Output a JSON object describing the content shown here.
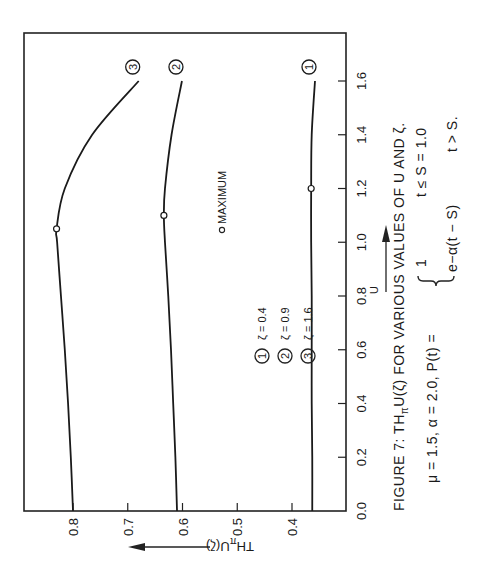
{
  "chart_data": {
    "type": "line",
    "title": "FIGURE 7:  THπU(ζ) FOR VARIOUS VALUES OF U AND ζ.",
    "xlabel": "U",
    "ylabel": "THπU(ζ)",
    "xlim": [
      0.0,
      1.75
    ],
    "ylim": [
      0.3,
      0.89
    ],
    "xticks": [
      0.0,
      0.2,
      0.4,
      0.6,
      0.8,
      1.0,
      1.2,
      1.4,
      1.6
    ],
    "xtick_labels": [
      "0.0",
      "0.2",
      "0.4",
      "0.6",
      "0.8",
      "1.0",
      "1.2",
      "1.4",
      "1.6"
    ],
    "yticks": [
      0.4,
      0.5,
      0.6,
      0.7,
      0.8
    ],
    "ytick_labels": [
      "0.4",
      "0.5",
      "0.6",
      "0.7",
      "0.8"
    ],
    "grid": false,
    "orientation": "rotated 90° counter-clockwise",
    "series": [
      {
        "name": "ζ = 0.4",
        "marker_label": "1",
        "x": [
          0.0,
          0.2,
          0.4,
          0.6,
          0.8,
          1.0,
          1.2,
          1.4,
          1.6
        ],
        "y": [
          0.363,
          0.363,
          0.364,
          0.364,
          0.364,
          0.365,
          0.365,
          0.364,
          0.358
        ],
        "maximum": {
          "x": 1.2,
          "y": 0.365
        }
      },
      {
        "name": "ζ = 0.9",
        "marker_label": "2",
        "x": [
          0.0,
          0.2,
          0.4,
          0.6,
          0.8,
          1.0,
          1.1,
          1.2,
          1.4,
          1.6
        ],
        "y": [
          0.61,
          0.613,
          0.617,
          0.621,
          0.626,
          0.632,
          0.634,
          0.632,
          0.62,
          0.601
        ],
        "maximum": {
          "x": 1.1,
          "y": 0.634
        }
      },
      {
        "name": "ζ = 1.6",
        "marker_label": "3",
        "x": [
          0.0,
          0.2,
          0.4,
          0.6,
          0.8,
          1.0,
          1.05,
          1.2,
          1.4,
          1.6
        ],
        "y": [
          0.8,
          0.804,
          0.809,
          0.815,
          0.822,
          0.829,
          0.83,
          0.815,
          0.765,
          0.68
        ],
        "maximum": {
          "x": 1.05,
          "y": 0.83
        }
      }
    ],
    "legend": {
      "placement": "center-left",
      "entries": [
        {
          "marker": "1",
          "label": "ζ = 0.4"
        },
        {
          "marker": "2",
          "label": "ζ = 0.9"
        },
        {
          "marker": "3",
          "label": "ζ = 1.6"
        }
      ]
    },
    "annotations": [
      {
        "text": "MAXIMUM",
        "marker": "open-circle"
      }
    ]
  },
  "caption": {
    "line1": "FIGURE 7:   THπU(ζ) FOR VARIOUS VALUES OF U AND ζ.",
    "line1_parts": {
      "prefix": "FIGURE 7:   TH",
      "sub": "π",
      "suffix": "U(ζ) FOR VARIOUS VALUES OF U AND ζ."
    },
    "params": "μ = 1.5,    α = 2.0,    P(t) =",
    "case1_value": "1",
    "case1_condition": "t ≤ S = 1.0",
    "case2_value": "e−α(t − S)",
    "case2_condition": "t > S."
  },
  "axis_titles": {
    "x": "U",
    "y_prefix": "TH",
    "y_sub": "π",
    "y_suffix": "U(ζ)"
  },
  "maximum_label": "MAXIMUM"
}
